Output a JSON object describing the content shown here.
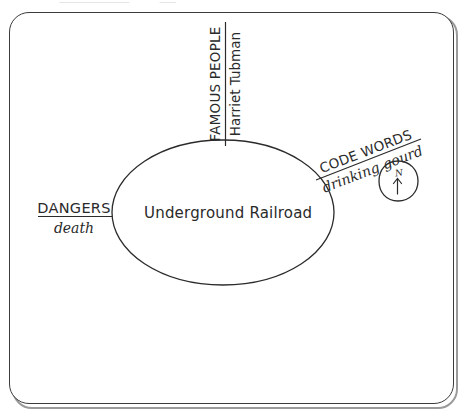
{
  "page": {
    "clipped_header_text": "Name  ______________  Date  ____",
    "background_color": "#ffffff",
    "ink_color": "#2b2b2b",
    "frame_outline_color": "#3b3b3b",
    "frame_shadow_color": "#9a9a9a"
  },
  "diagram": {
    "type": "concept-map",
    "center": {
      "label": "Underground Railroad",
      "shape": "ellipse"
    },
    "branches": [
      {
        "id": "dangers",
        "category": "DANGERS",
        "example": "death",
        "position": "left",
        "rotation_deg": 0
      },
      {
        "id": "famous-people",
        "category": "FAMOUS PEOPLE",
        "example": "Harriet Tubman",
        "position": "top",
        "rotation_deg": -90
      },
      {
        "id": "code-words",
        "category": "CODE WORDS",
        "example": "drinking gourd",
        "position": "right",
        "rotation_deg": -21
      }
    ],
    "compass": {
      "label": "N",
      "direction": "up",
      "shape": "hand-drawn-circle"
    }
  }
}
